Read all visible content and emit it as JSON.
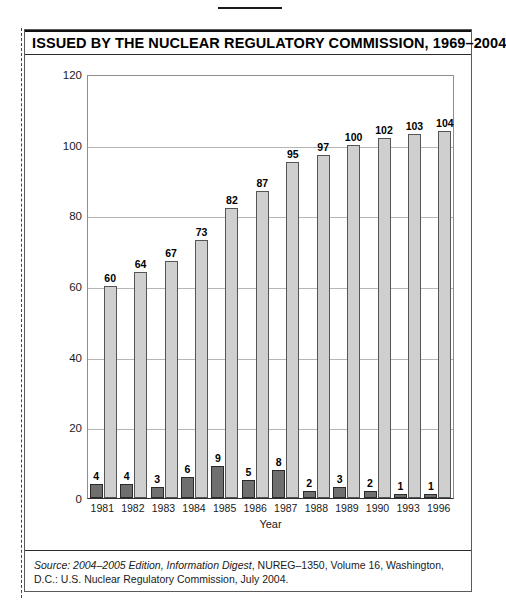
{
  "figure": {
    "title": "ISSUED BY THE NUCLEAR REGULATORY COMMISSION, 1969–2004",
    "source_prefix_italic": "Source: 2004–2005 Edition, Information Digest",
    "source_rest": ", NUREG–1350, Volume 16, Washington, D.C.: U.S. Nuclear Regulatory Commission, July 2004.",
    "colors": {
      "bar_dark": "#6f6f6f",
      "bar_dark_border": "#2a2a2a",
      "bar_light": "#cfcfcf",
      "bar_light_border": "#555555",
      "gridline": "#b5b5b5",
      "axis": "#2f2f2f",
      "text": "#1a1a1a"
    }
  },
  "chart_data": {
    "type": "bar",
    "title": "ISSUED BY THE NUCLEAR REGULATORY COMMISSION, 1969–2004",
    "xlabel": "Year",
    "ylabel": "",
    "ylim": [
      0,
      120
    ],
    "yticks": [
      0,
      20,
      40,
      60,
      80,
      100,
      120
    ],
    "ytick_labels": [
      "0",
      "20",
      "40",
      "60",
      "80",
      "100",
      "120"
    ],
    "grid": true,
    "legend": null,
    "categories": [
      "1981",
      "1982",
      "1983",
      "1984",
      "1985",
      "1986",
      "1987",
      "1988",
      "1989",
      "1990",
      "1993",
      "1996"
    ],
    "series": [
      {
        "name": "dark-series",
        "color": "#6f6f6f",
        "values": [
          4,
          4,
          3,
          6,
          9,
          5,
          8,
          2,
          3,
          2,
          1,
          1
        ],
        "labels": [
          "4",
          "4",
          "3",
          "6",
          "9",
          "5",
          "8",
          "2",
          "3",
          "2",
          "1",
          "1"
        ]
      },
      {
        "name": "light-series",
        "color": "#cfcfcf",
        "values": [
          60,
          64,
          67,
          73,
          82,
          87,
          95,
          97,
          100,
          102,
          103,
          104
        ],
        "labels": [
          "60",
          "64",
          "67",
          "73",
          "82",
          "87",
          "95",
          "97",
          "100",
          "102",
          "103",
          "104"
        ]
      }
    ]
  }
}
